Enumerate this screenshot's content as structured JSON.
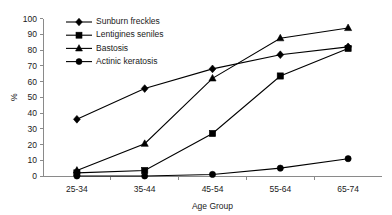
{
  "chart_data": {
    "type": "line",
    "title": "",
    "xlabel": "Age Group",
    "ylabel": "%",
    "categories": [
      "25-34",
      "35-44",
      "45-54",
      "55-64",
      "65-74"
    ],
    "ylim": [
      0,
      100
    ],
    "yticks": [
      0,
      10,
      20,
      30,
      40,
      50,
      60,
      70,
      80,
      90,
      100
    ],
    "grid": false,
    "legend_position": "top-left-inside",
    "series": [
      {
        "name": "Sunburn freckles",
        "marker": "diamond",
        "values": [
          36,
          55.5,
          68,
          77,
          82
        ]
      },
      {
        "name": "Lentigines seniles",
        "marker": "square",
        "values": [
          2,
          3.5,
          27,
          63.5,
          81
        ]
      },
      {
        "name": "Bastosis",
        "marker": "triangle",
        "values": [
          3.5,
          20.5,
          62,
          87.5,
          94
        ]
      },
      {
        "name": "Actinic keratosis",
        "marker": "circle",
        "values": [
          0,
          0,
          1,
          5,
          11
        ]
      }
    ]
  },
  "axis": {
    "y_tick_labels": [
      "0",
      "10",
      "20",
      "30",
      "40",
      "50",
      "60",
      "70",
      "80",
      "90",
      "100"
    ],
    "x_tick_labels": [
      "25-34",
      "35-44",
      "45-54",
      "55-64",
      "65-74"
    ],
    "y_title": "%",
    "x_title": "Age Group"
  },
  "legend": {
    "items": [
      {
        "label": "Sunburn freckles",
        "marker": "diamond"
      },
      {
        "label": "Lentigines seniles",
        "marker": "square"
      },
      {
        "label": "Bastosis",
        "marker": "triangle"
      },
      {
        "label": "Actinic keratosis",
        "marker": "circle"
      }
    ]
  },
  "colors": {
    "series": "#000000",
    "axis": "#8a8a8a",
    "text": "#1a1a1a",
    "background": "#ffffff"
  }
}
